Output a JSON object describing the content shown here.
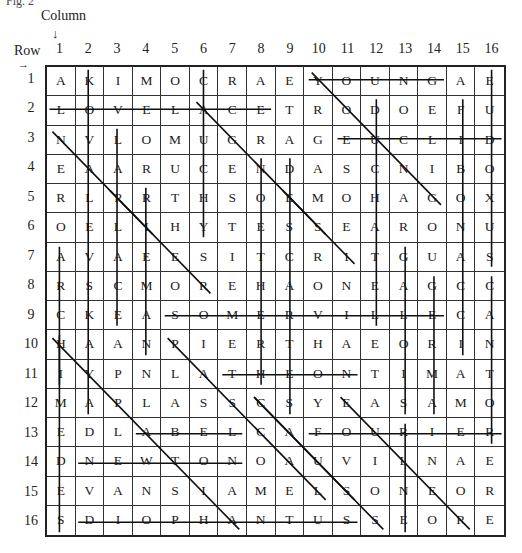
{
  "caption": "Fig. 2",
  "labels": {
    "column_title": "Column",
    "column_arrow": "↓",
    "row_title": "Row",
    "row_arrow": "→"
  },
  "column_numbers": [
    "1",
    "2",
    "3",
    "4",
    "5",
    "6",
    "7",
    "8",
    "9",
    "10",
    "11",
    "12",
    "13",
    "14",
    "15",
    "16"
  ],
  "row_numbers": [
    "1",
    "2",
    "3",
    "4",
    "5",
    "6",
    "7",
    "8",
    "9",
    "10",
    "11",
    "12",
    "13",
    "14",
    "15",
    "16"
  ],
  "grid": [
    [
      "A",
      "K",
      "I",
      "M",
      "O",
      "C",
      "R",
      "A",
      "E",
      "Y",
      "O",
      "U",
      "N",
      "G",
      "A",
      "E"
    ],
    [
      "L",
      "O",
      "V",
      "E",
      "L",
      "A",
      "C",
      "E",
      "T",
      "R",
      "O",
      "D",
      "O",
      "E",
      "F",
      "U"
    ],
    [
      "N",
      "V",
      "L",
      "O",
      "M",
      "U",
      "G",
      "R",
      "A",
      "G",
      "E",
      "U",
      "C",
      "L",
      "I",
      "D"
    ],
    [
      "E",
      "A",
      "A",
      "R",
      "U",
      "C",
      "E",
      "N",
      "D",
      "A",
      "S",
      "C",
      "N",
      "I",
      "B",
      "O"
    ],
    [
      "R",
      "L",
      "P",
      "R",
      "T",
      "H",
      "S",
      "O",
      "E",
      "M",
      "O",
      "H",
      "A",
      "G",
      "O",
      "X"
    ],
    [
      "O",
      "E",
      "L",
      "I",
      "H",
      "Y",
      "T",
      "E",
      "S",
      "S",
      "E",
      "A",
      "R",
      "O",
      "N",
      "U"
    ],
    [
      "A",
      "V",
      "A",
      "E",
      "E",
      "S",
      "I",
      "T",
      "C",
      "R",
      "I",
      "T",
      "G",
      "U",
      "A",
      "S"
    ],
    [
      "R",
      "S",
      "C",
      "M",
      "O",
      "R",
      "E",
      "H",
      "A",
      "O",
      "N",
      "E",
      "A",
      "G",
      "C",
      "C"
    ],
    [
      "C",
      "K",
      "E",
      "A",
      "S",
      "O",
      "M",
      "E",
      "R",
      "V",
      "I",
      "L",
      "L",
      "E",
      "C",
      "A"
    ],
    [
      "H",
      "A",
      "A",
      "N",
      "P",
      "I",
      "E",
      "R",
      "T",
      "H",
      "A",
      "E",
      "O",
      "R",
      "I",
      "N"
    ],
    [
      "I",
      "Y",
      "P",
      "N",
      "L",
      "A",
      "T",
      "H",
      "E",
      "O",
      "N",
      "T",
      "I",
      "M",
      "A",
      "T"
    ],
    [
      "M",
      "A",
      "P",
      "L",
      "A",
      "S",
      "S",
      "C",
      "S",
      "Y",
      "E",
      "A",
      "S",
      "A",
      "M",
      "O"
    ],
    [
      "E",
      "D",
      "L",
      "A",
      "B",
      "E",
      "L",
      "C",
      "A",
      "F",
      "O",
      "U",
      "R",
      "I",
      "E",
      "R"
    ],
    [
      "D",
      "N",
      "E",
      "W",
      "T",
      "O",
      "N",
      "O",
      "A",
      "U",
      "V",
      "I",
      "L",
      "N",
      "A",
      "E"
    ],
    [
      "E",
      "V",
      "A",
      "N",
      "S",
      "I",
      "A",
      "M",
      "E",
      "L",
      "S",
      "O",
      "N",
      "E",
      "O",
      "R"
    ],
    [
      "S",
      "D",
      "I",
      "O",
      "P",
      "H",
      "A",
      "N",
      "T",
      "U",
      "S",
      "S",
      "E",
      "O",
      "R",
      "E"
    ]
  ],
  "strike_lines": [
    {
      "word": "YOUNG",
      "from": [
        1,
        10
      ],
      "to": [
        1,
        14
      ]
    },
    {
      "word": "LOVELACE",
      "from": [
        2,
        1
      ],
      "to": [
        2,
        8
      ]
    },
    {
      "word": "EUCLID",
      "from": [
        3,
        11
      ],
      "to": [
        3,
        16
      ]
    },
    {
      "word": "SOMERVILLE",
      "from": [
        9,
        5
      ],
      "to": [
        9,
        14
      ]
    },
    {
      "word": "THEON",
      "from": [
        11,
        7
      ],
      "to": [
        11,
        11
      ]
    },
    {
      "word": "ABEL",
      "from": [
        13,
        4
      ],
      "to": [
        13,
        7
      ]
    },
    {
      "word": "FOURIER",
      "from": [
        13,
        10
      ],
      "to": [
        13,
        16
      ]
    },
    {
      "word": "NEWTON",
      "from": [
        14,
        2
      ],
      "to": [
        14,
        7
      ]
    },
    {
      "word": "DIOPHANTUS",
      "from": [
        16,
        2
      ],
      "to": [
        16,
        11
      ]
    },
    {
      "word": "KOVALEVSKAYA",
      "from": [
        1,
        2
      ],
      "to": [
        12,
        2
      ]
    },
    {
      "word": "CAUCHY",
      "from": [
        1,
        6
      ],
      "to": [
        6,
        6
      ]
    },
    {
      "word": "LAPLACE",
      "from": [
        3,
        3
      ],
      "to": [
        9,
        3
      ]
    },
    {
      "word": "ERDOS",
      "from": [
        5,
        4
      ],
      "to": [
        10,
        4
      ]
    },
    {
      "word": "AREAS",
      "from": [
        7,
        1
      ],
      "to": [
        11,
        1
      ]
    },
    {
      "word": "HERMITE",
      "from": [
        10,
        1
      ],
      "to": [
        16,
        1
      ]
    },
    {
      "word": "NOETHER",
      "from": [
        4,
        8
      ],
      "to": [
        11,
        8
      ]
    },
    {
      "word": "DESCARTES",
      "from": [
        4,
        9
      ],
      "to": [
        12,
        9
      ]
    },
    {
      "word": "DUCHATELET",
      "from": [
        2,
        12
      ],
      "to": [
        9,
        12
      ]
    },
    {
      "word": "GALOIS",
      "from": [
        7,
        13
      ],
      "to": [
        12,
        13
      ]
    },
    {
      "word": "GAUSS",
      "from": [
        8,
        14
      ],
      "to": [
        12,
        14
      ]
    },
    {
      "word": "FIBONACCI",
      "from": [
        2,
        15
      ],
      "to": [
        10,
        15
      ]
    },
    {
      "word": "EUCLIDS",
      "from": [
        1,
        16
      ],
      "to": [
        7,
        16
      ]
    },
    {
      "word": "CANTOR",
      "from": [
        8,
        16
      ],
      "to": [
        13,
        16
      ]
    },
    {
      "word": "LRIEM",
      "from": [
        13,
        13
      ],
      "to": [
        16,
        13
      ]
    },
    {
      "word": "NABLA",
      "from": [
        3,
        1
      ],
      "to": [
        6,
        4
      ]
    },
    {
      "word": "ACUGRAGEDIN",
      "from": [
        2,
        6
      ],
      "to": [
        6,
        10
      ]
    },
    {
      "word": "YODAG",
      "from": [
        1,
        10
      ],
      "to": [
        5,
        14
      ]
    },
    {
      "word": "PRESIT",
      "from": [
        5,
        3
      ],
      "to": [
        8,
        6
      ]
    },
    {
      "word": "HEEMSSTRI",
      "from": [
        5,
        9
      ],
      "to": [
        7,
        11
      ]
    },
    {
      "word": "HYPATIA",
      "from": [
        10,
        1
      ],
      "to": [
        16,
        7
      ]
    },
    {
      "word": "PASCAL",
      "from": [
        10,
        5
      ],
      "to": [
        15,
        10
      ]
    },
    {
      "word": "CAUS",
      "from": [
        12,
        8
      ],
      "to": [
        16,
        12
      ]
    },
    {
      "word": "GOALS",
      "from": [
        12,
        8
      ],
      "to": [
        15,
        11
      ]
    },
    {
      "word": "EUCLIDE",
      "from": [
        12,
        11
      ],
      "to": [
        16,
        15
      ]
    }
  ]
}
